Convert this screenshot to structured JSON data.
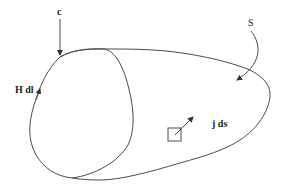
{
  "diagram": {
    "labels": {
      "curve": "c",
      "surface": "S",
      "line_element": "H dl",
      "area_element": "j ds"
    },
    "colors": {
      "stroke": "#4a4a4a",
      "text": "#222222",
      "background": "#ffffff"
    }
  }
}
